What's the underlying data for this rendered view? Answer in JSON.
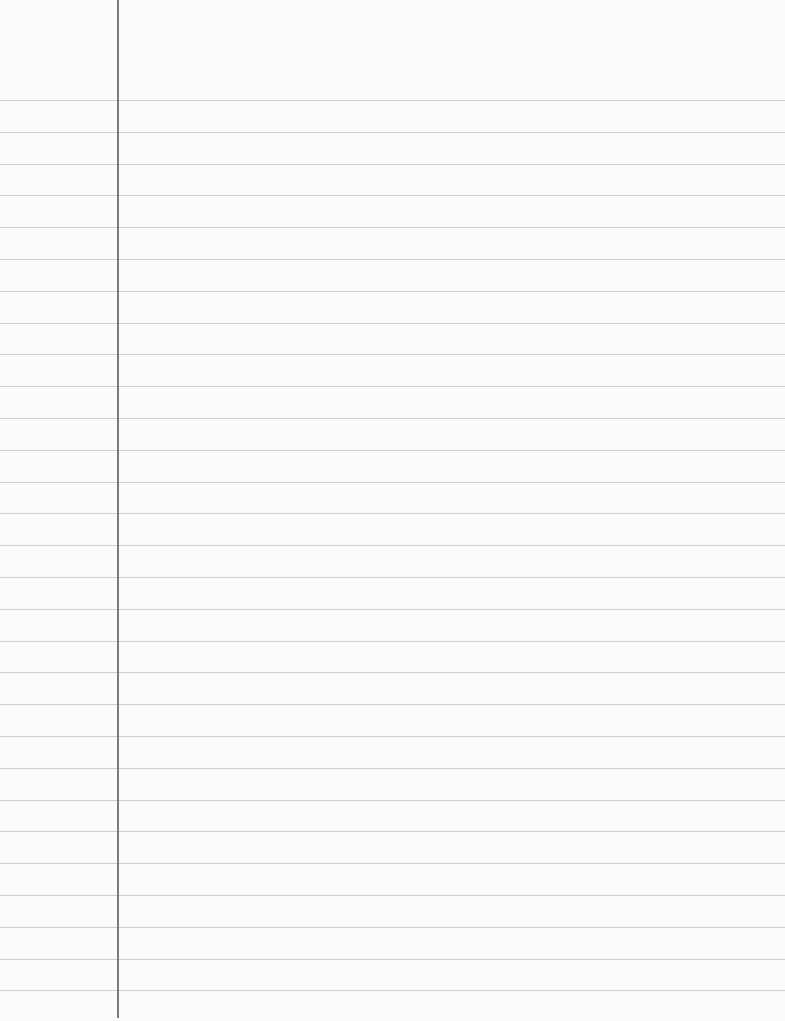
{
  "paper": {
    "type": "lined-notebook-page",
    "background_color": "#fbfbfa",
    "rule_color": "#cfcfcf",
    "margin_line_color": "#7a7a7a",
    "first_rule_y": 100,
    "rule_spacing": 31.8,
    "rule_count": 29,
    "margin_x": 117,
    "content": ""
  }
}
